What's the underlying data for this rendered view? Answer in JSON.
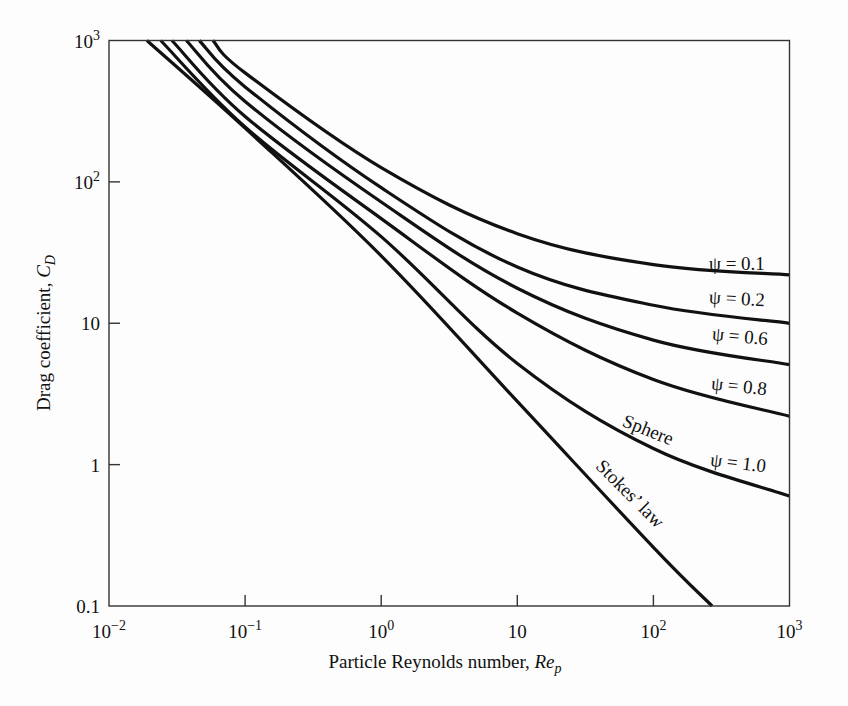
{
  "chart_data": {
    "type": "line",
    "title": "",
    "xlabel": "Particle Reynolds number, Re_p",
    "ylabel": "Drag coefficient, C_D",
    "xscale": "log",
    "yscale": "log",
    "xlim": [
      0.01,
      1000
    ],
    "ylim": [
      0.1,
      1000
    ],
    "grid": false,
    "legend": "inline curve labels",
    "x_ticks": [
      {
        "value": 0.01,
        "label": "10",
        "sup": "−2"
      },
      {
        "value": 0.1,
        "label": "10",
        "sup": "−1"
      },
      {
        "value": 1,
        "label": "10",
        "sup": "0"
      },
      {
        "value": 10,
        "label": "10",
        "sup": ""
      },
      {
        "value": 100,
        "label": "10",
        "sup": "2"
      },
      {
        "value": 1000,
        "label": "10",
        "sup": "3"
      }
    ],
    "y_ticks": [
      {
        "value": 0.1,
        "label": "0.1",
        "sup": ""
      },
      {
        "value": 1,
        "label": "1",
        "sup": ""
      },
      {
        "value": 10,
        "label": "10",
        "sup": ""
      },
      {
        "value": 100,
        "label": "10",
        "sup": "2"
      },
      {
        "value": 1000,
        "label": "10",
        "sup": "3"
      }
    ],
    "series": [
      {
        "name": "ψ = 0.1",
        "x": [
          0.058,
          0.1,
          1,
          10,
          100,
          1000
        ],
        "y": [
          1000,
          590,
          126,
          43,
          26,
          22
        ]
      },
      {
        "name": "ψ = 0.2",
        "x": [
          0.046,
          0.1,
          1,
          10,
          100,
          1000
        ],
        "y": [
          1000,
          470,
          91,
          25,
          13.4,
          10
        ]
      },
      {
        "name": "ψ = 0.6",
        "x": [
          0.037,
          0.1,
          1,
          10,
          100,
          1000
        ],
        "y": [
          1000,
          370,
          72,
          17.7,
          7.6,
          5.1
        ]
      },
      {
        "name": "ψ = 0.8",
        "x": [
          0.029,
          0.1,
          1,
          10,
          100,
          1000
        ],
        "y": [
          1000,
          290,
          55,
          11.8,
          4.0,
          2.2
        ]
      },
      {
        "name": "ψ = 1.0 (Sphere)",
        "x": [
          0.024,
          0.1,
          1,
          10,
          100,
          1000
        ],
        "y": [
          1000,
          245,
          41,
          5.2,
          1.3,
          0.6
        ]
      },
      {
        "name": "Stokes' law",
        "x": [
          0.019,
          0.1,
          1,
          10,
          100,
          270
        ],
        "y": [
          1000,
          240,
          30,
          2.8,
          0.26,
          0.1
        ]
      }
    ],
    "annotations": [
      {
        "text": "ψ = 0.1",
        "x": 240,
        "y": 30
      },
      {
        "text": "ψ = 0.2",
        "x": 240,
        "y": 13.5
      },
      {
        "text": "ψ = 0.6",
        "x": 240,
        "y": 7.2
      },
      {
        "text": "ψ = 0.8",
        "x": 240,
        "y": 3.6
      },
      {
        "text": "ψ = 1.0",
        "x": 240,
        "y": 0.95
      },
      {
        "text": "Sphere",
        "x": 100,
        "y": 2.1
      },
      {
        "text": "Stokes’ law",
        "x": 80,
        "y": 0.6
      }
    ]
  },
  "labels": {
    "x_title_main": "Particle Reynolds number, ",
    "x_title_var": "Re",
    "x_title_sub": "p",
    "y_title_main": "Drag coefficient, ",
    "y_title_var": "C",
    "y_title_sub": "D",
    "sphere": "Sphere",
    "stokes": "Stokes’ law",
    "psi_01": "ψ = 0.1",
    "psi_02": "ψ = 0.2",
    "psi_06": "ψ = 0.6",
    "psi_08": "ψ = 0.8",
    "psi_10": "ψ = 1.0"
  },
  "style": {
    "line_color": "#111111",
    "axis_color": "#333333",
    "background": "#fdfdfd"
  }
}
